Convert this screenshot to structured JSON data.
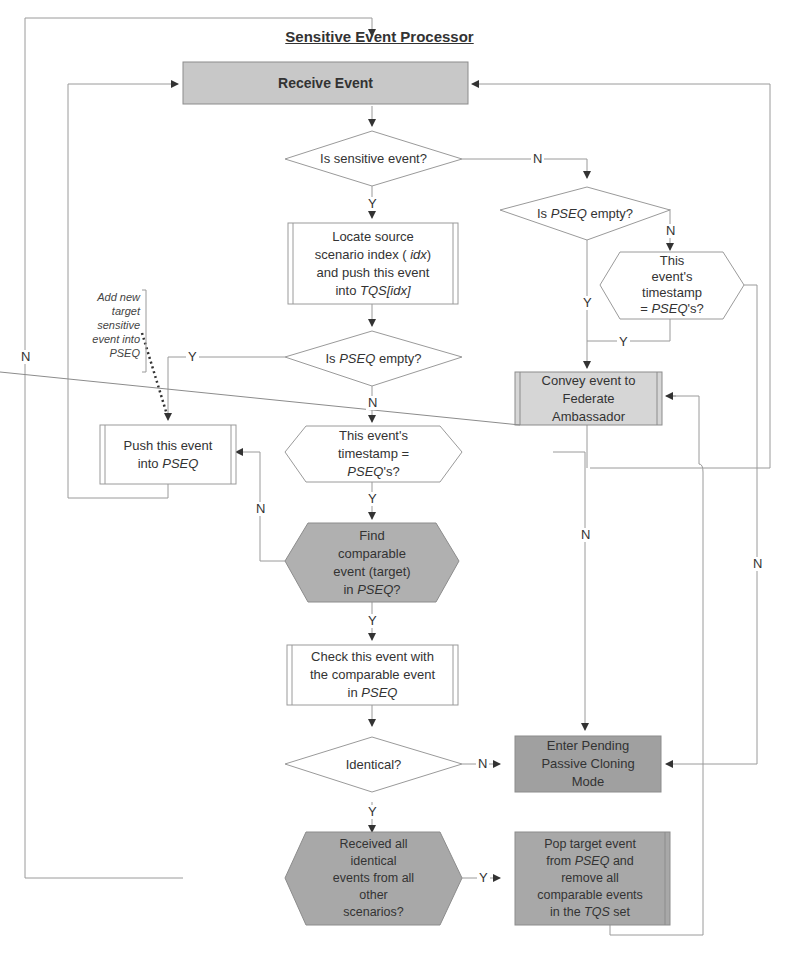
{
  "title": "Sensitive Event Processor",
  "nodes": {
    "receive_event": "Receive Event",
    "is_sensitive": "Is sensitive event?",
    "locate_source": [
      "Locate source",
      "scenario index ( ",
      "idx",
      ")",
      "and push this event",
      "into ",
      "TQS[idx]"
    ],
    "is_pseq_empty_left": [
      "Is ",
      "PSEQ",
      " empty?"
    ],
    "push_event": [
      "Push this event",
      "into ",
      "PSEQ"
    ],
    "timestamp_center": [
      "This event's",
      "timestamp =",
      "PSEQ",
      "'s?"
    ],
    "find_comparable": [
      "Find",
      "comparable",
      "event (target)",
      "in ",
      "PSEQ",
      "?"
    ],
    "check_event": [
      "Check this event with",
      "the comparable event",
      "in ",
      "PSEQ"
    ],
    "identical": "Identical?",
    "received_all": [
      "Received all",
      "identical",
      "events from all",
      "other",
      "scenarios?"
    ],
    "pop_target": [
      "Pop target event",
      "from ",
      "PSEQ",
      " and",
      "remove all",
      "comparable events",
      "in the ",
      "TQS",
      " set"
    ],
    "is_pseq_empty_right": [
      "Is ",
      "PSEQ",
      " empty?"
    ],
    "timestamp_right": [
      "This",
      "event's",
      "timestamp",
      "= ",
      "PSEQ",
      "'s?"
    ],
    "convey_event": [
      "Convey event to",
      "Federate",
      "Ambassador"
    ],
    "enter_pending": [
      "Enter Pending",
      "Passive Cloning",
      "Mode"
    ]
  },
  "annotation": [
    "Add new",
    "target",
    "sensitive",
    "event into",
    "PSEQ"
  ],
  "edge_labels": {
    "yes": "Y",
    "no": "N"
  },
  "colors": {
    "line": "#9a9a9a",
    "light_fill": "#d6d6d6",
    "dark_fill": "#a8a8a8",
    "stroke": "#8c8c8c"
  }
}
